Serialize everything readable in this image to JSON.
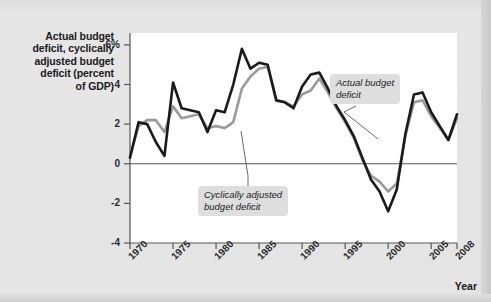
{
  "figure": {
    "y_axis_title": "Actual budget deficit, cyclically adjusted budget deficit (percent of GDP)",
    "y_axis_title_lines": [
      "Actual budget",
      "deficit, cyclically",
      "adjusted budget",
      "deficit (percent",
      "of GDP)"
    ],
    "x_axis_title": "Year",
    "annotations": [
      {
        "name": "actual-budget-deficit-callout",
        "text": "Actual budget\ndeficit"
      },
      {
        "name": "cyclically-adjusted-callout",
        "text": "Cyclically adjusted\nbudget deficit"
      }
    ],
    "colors": {
      "background": "#e4e4e4",
      "plot_background": "#ffffff",
      "actual_line": "#1a1a1a",
      "cyclically_adjusted_line": "#9a9a9a",
      "zero_line": "#555555",
      "axis": "#555555",
      "callout_background": "#dedede"
    }
  },
  "chart_data": {
    "type": "line",
    "title": "",
    "xlabel": "Year",
    "ylabel": "Actual budget deficit, cyclically adjusted budget deficit (percent of GDP)",
    "xlim": [
      1970,
      2008
    ],
    "ylim": [
      -4,
      6.6
    ],
    "yticks": [
      6,
      4,
      2,
      0,
      -2,
      -4
    ],
    "ytick_labels": [
      "6%",
      "4",
      "2",
      "0",
      "-2",
      "-4"
    ],
    "xticks": [
      1970,
      1975,
      1980,
      1985,
      1990,
      1995,
      2000,
      2005,
      2008
    ],
    "xtick_labels": [
      "1970",
      "1975",
      "1980",
      "1985",
      "1990",
      "1995",
      "2000",
      "2005",
      "2008"
    ],
    "grid": false,
    "legend": "annotated-inline",
    "x": [
      1970,
      1971,
      1972,
      1973,
      1974,
      1975,
      1976,
      1977,
      1978,
      1979,
      1980,
      1981,
      1982,
      1983,
      1984,
      1985,
      1986,
      1987,
      1988,
      1989,
      1990,
      1991,
      1992,
      1993,
      1994,
      1995,
      1996,
      1997,
      1998,
      1999,
      2000,
      2001,
      2002,
      2003,
      2004,
      2005,
      2006,
      2007,
      2008
    ],
    "series": [
      {
        "name": "Actual budget deficit",
        "color": "#1a1a1a",
        "values": [
          0.3,
          2.1,
          2.0,
          1.1,
          0.4,
          4.1,
          2.8,
          2.7,
          2.6,
          1.6,
          2.7,
          2.6,
          4.0,
          5.8,
          4.8,
          5.1,
          5.0,
          3.2,
          3.1,
          2.8,
          3.9,
          4.5,
          4.6,
          3.8,
          2.9,
          2.2,
          1.4,
          0.3,
          -0.8,
          -1.4,
          -2.4,
          -1.3,
          1.5,
          3.5,
          3.6,
          2.6,
          1.9,
          1.2,
          2.5
        ]
      },
      {
        "name": "Cyclically adjusted budget deficit",
        "color": "#9a9a9a",
        "values": [
          0.4,
          1.9,
          2.2,
          2.2,
          1.6,
          2.9,
          2.3,
          2.4,
          2.5,
          1.8,
          1.9,
          1.8,
          2.1,
          3.8,
          4.4,
          4.8,
          4.9,
          3.2,
          3.1,
          2.9,
          3.5,
          3.7,
          4.3,
          3.6,
          2.8,
          2.1,
          1.3,
          0.2,
          -0.6,
          -0.9,
          -1.4,
          -1.0,
          1.4,
          3.1,
          3.2,
          2.4,
          1.8,
          1.2,
          2.3
        ]
      }
    ]
  }
}
